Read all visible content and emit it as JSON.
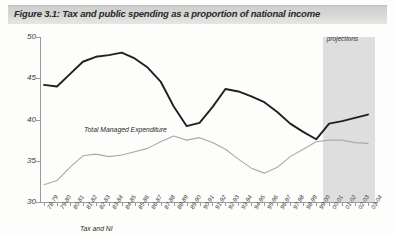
{
  "figure": {
    "title": "Figure 3.1: Tax and public spending as a proportion of national income"
  },
  "annotations": {
    "projections": "projections",
    "series_label_tme": "Total Managed Expenditure",
    "series_label_tax": "Tax and NI"
  },
  "chart_data": {
    "type": "line",
    "title": "Figure 3.1: Tax and public spending as a proportion of national income",
    "xlabel": "",
    "ylabel": "percentage of GDP",
    "ylim": [
      30,
      50
    ],
    "yticks": [
      30,
      35,
      40,
      45,
      50
    ],
    "ytick_labels": [
      "30",
      "35",
      "40",
      "45",
      "50"
    ],
    "grid": false,
    "legend_position": "inline-labels",
    "categories": [
      "78-79",
      "79-80",
      "80-81",
      "81-82",
      "82-83",
      "83-84",
      "84-85",
      "85-86",
      "86-87",
      "87-88",
      "88-89",
      "89-90",
      "90-91",
      "91-92",
      "92-93",
      "93-94",
      "94-95",
      "95-96",
      "96-97",
      "97-98",
      "98-99",
      "99-00",
      "00-01",
      "01-02",
      "02-03",
      "03-04"
    ],
    "series": [
      {
        "name": "Total Managed Expenditure",
        "color": "#231f20",
        "values": [
          44.2,
          44.0,
          45.5,
          47.0,
          47.6,
          47.8,
          48.1,
          47.4,
          46.3,
          44.6,
          41.6,
          39.2,
          39.6,
          41.5,
          43.7,
          43.4,
          42.8,
          42.1,
          40.9,
          39.5,
          38.5,
          37.6,
          39.5,
          39.8,
          40.2,
          40.6
        ]
      },
      {
        "name": "Tax and NI",
        "color": "#a9a9a9",
        "values": [
          32.1,
          32.6,
          34.2,
          35.6,
          35.8,
          35.5,
          35.7,
          36.1,
          36.5,
          37.3,
          38.0,
          37.5,
          37.8,
          37.2,
          36.4,
          35.2,
          34.1,
          33.5,
          34.2,
          35.5,
          36.4,
          37.3,
          37.5,
          37.5,
          37.2,
          37.1
        ]
      }
    ],
    "projection_region": {
      "label": "projections",
      "start_category": "00-01",
      "end_category": "03-04"
    }
  }
}
